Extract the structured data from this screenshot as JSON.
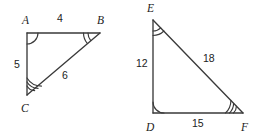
{
  "figure": {
    "width": 267,
    "height": 137,
    "background_color": "#ffffff",
    "stroke_color": "#3a3a3a",
    "text_color": "#1c1c1c"
  },
  "triangles": [
    {
      "id": "ABC",
      "name": "triangle-abc",
      "vertices": [
        {
          "label": "A",
          "x": 27,
          "y": 33,
          "label_x": 22,
          "label_y": 24,
          "arcs": 1
        },
        {
          "label": "B",
          "x": 100,
          "y": 33,
          "label_x": 97,
          "label_y": 24,
          "arcs": 2
        },
        {
          "label": "C",
          "x": 27,
          "y": 95,
          "label_x": 21,
          "label_y": 112,
          "arcs": 3
        }
      ],
      "sides": [
        {
          "name": "side-ab",
          "label": "4",
          "from": "A",
          "to": "B",
          "label_x": 57,
          "label_y": 22
        },
        {
          "name": "side-ac",
          "label": "5",
          "from": "A",
          "to": "C",
          "label_x": 14,
          "label_y": 68
        },
        {
          "name": "side-cb",
          "label": "6",
          "from": "C",
          "to": "B",
          "label_x": 62,
          "label_y": 79
        }
      ]
    },
    {
      "id": "DEF",
      "name": "triangle-def",
      "vertices": [
        {
          "label": "E",
          "x": 153,
          "y": 20,
          "label_x": 147,
          "label_y": 12,
          "arcs": 2
        },
        {
          "label": "D",
          "x": 153,
          "y": 113,
          "label_x": 146,
          "label_y": 131,
          "arcs": 1
        },
        {
          "label": "F",
          "x": 243,
          "y": 113,
          "label_x": 241,
          "label_y": 131,
          "arcs": 3
        }
      ],
      "sides": [
        {
          "name": "side-ed",
          "label": "12",
          "from": "E",
          "to": "D",
          "label_x": 136,
          "label_y": 67
        },
        {
          "name": "side-ef",
          "label": "18",
          "from": "E",
          "to": "F",
          "label_x": 203,
          "label_y": 62
        },
        {
          "name": "side-df",
          "label": "15",
          "from": "D",
          "to": "F",
          "label_x": 192,
          "label_y": 127
        }
      ]
    }
  ]
}
